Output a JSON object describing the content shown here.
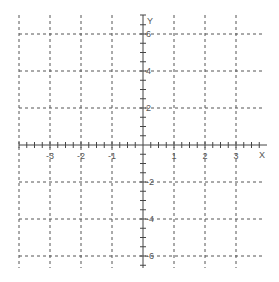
{
  "chart_data": {
    "type": "scatter",
    "title": "",
    "xlabel": "X",
    "ylabel": "Y",
    "xlim": [
      -4,
      4
    ],
    "ylim": [
      -7,
      7
    ],
    "grid": true,
    "x_major_ticks": [
      -3,
      -2,
      -1,
      1,
      2,
      3
    ],
    "y_major_ticks": [
      6,
      4,
      2,
      -2,
      -4,
      -6
    ],
    "x_tick_labels": [
      "-3",
      "-2",
      "-1",
      "1",
      "2",
      "3"
    ],
    "y_tick_labels": [
      "6",
      "4",
      "2",
      "-2",
      "-4",
      "-6"
    ],
    "x_minor_step": 0.25,
    "y_minor_step": 0.5,
    "series": []
  },
  "colors": {
    "grid": "#555555",
    "axis": "#444444",
    "label": "#555555"
  }
}
